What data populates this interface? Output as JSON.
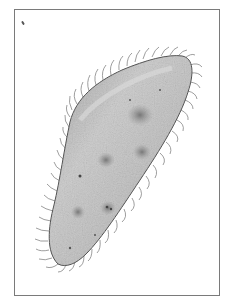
{
  "image": {
    "subject": "paramecium illustration",
    "description": "Grayscale stippled drawing of a ciliated single-celled organism (paramecium) oriented diagonally inside a thin rectangular frame",
    "colors": {
      "background": "#ffffff",
      "frame": "#7a7a7a",
      "body_fill_light": "#c4c4c4",
      "body_fill_dark": "#8a8a8a",
      "outline": "#4a4a4a",
      "cilia": "#6e6e6e",
      "vacuoles": "#7d7d7d"
    }
  }
}
